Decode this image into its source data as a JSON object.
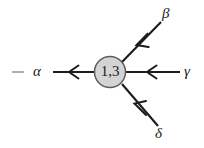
{
  "figure": {
    "width": 204,
    "height": 148,
    "background_color": "#ffffff",
    "kind": "feynman-style vertex diagram"
  },
  "node": {
    "label": "1,3",
    "shape": "circle",
    "fill_color": "#d4d4d4",
    "stroke_color": "#5d5d5d",
    "center_x": 110,
    "center_y": 72,
    "radius": 15.5
  },
  "labels": {
    "alpha": "α",
    "beta": "β",
    "gamma": "γ",
    "delta": "δ"
  },
  "edges": [
    {
      "name": "alpha-edge",
      "label": "α",
      "direction": "outgoing-left",
      "arrow_points": "left",
      "from_x": 95,
      "from_y": 72,
      "to_x": 53,
      "to_y": 72
    },
    {
      "name": "beta-edge",
      "label": "β",
      "direction": "incoming-from-upper-right",
      "arrow_points": "down-left",
      "from_x": 161,
      "from_y": 22,
      "to_x": 122,
      "to_y": 62
    },
    {
      "name": "gamma-edge",
      "label": "γ",
      "direction": "incoming-from-right",
      "arrow_points": "left",
      "from_x": 180,
      "from_y": 72,
      "to_x": 126,
      "to_y": 72
    },
    {
      "name": "delta-edge",
      "label": "δ",
      "direction": "incoming-from-lower-right",
      "arrow_points": "up-left",
      "from_x": 158,
      "from_y": 126,
      "to_x": 122,
      "to_y": 84
    }
  ],
  "stub": {
    "name": "left-dash-stub",
    "color": "#9a9a9a",
    "x1": 12,
    "y1": 72,
    "x2": 24,
    "y2": 72
  }
}
